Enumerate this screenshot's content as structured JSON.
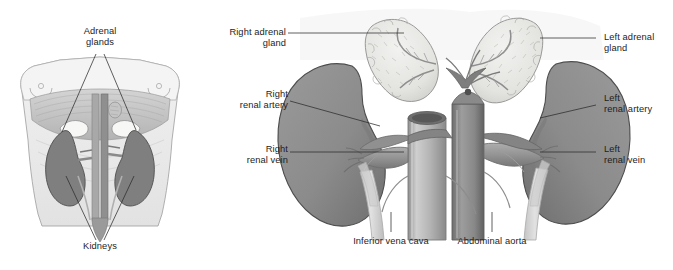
{
  "figure": {
    "type": "anatomical-illustration",
    "style": "grayscale medical line-and-wash drawing",
    "background_color": "#ffffff"
  },
  "palette": {
    "kidney_fill": "#8d8d8d",
    "kidney_fill_dark": "#6f6f6f",
    "kidney_edge": "#4a4a4a",
    "adrenal_fill": "#e6e6e4",
    "adrenal_edge": "#9a9a98",
    "vessel_light": "#b9b9b9",
    "vessel_mid": "#9c9c9c",
    "vessel_dark": "#7a7a7a",
    "ureter_fill": "#d2d2d2",
    "body_fill": "#ebebeb",
    "muscle_fill": "#c9c9c9",
    "leader_line": "#2b2b2b",
    "text": "#1d1d1d"
  },
  "inset_panel": {
    "name": "torso-overview",
    "description": "Anterior view of abdomen showing kidneys and adrenal glands in situ",
    "labels": [
      {
        "id": "adrenal-glands",
        "text": "Adrenal\nglands",
        "align": "center",
        "x": 100,
        "y": 28
      },
      {
        "id": "kidneys",
        "text": "Kidneys",
        "align": "center",
        "x": 100,
        "y": 243
      }
    ]
  },
  "main_panel": {
    "name": "kidney-detail",
    "description": "Detailed anterior view of both kidneys, adrenal glands, renal vessels, inferior vena cava and abdominal aorta",
    "labels": [
      {
        "id": "right-adrenal-gland",
        "text": "Right adrenal\ngland",
        "align": "right",
        "side": "left",
        "x": 206,
        "y": 30
      },
      {
        "id": "right-renal-artery",
        "text": "Right\nrenal artery",
        "align": "right",
        "side": "left",
        "x": 218,
        "y": 92
      },
      {
        "id": "right-renal-vein",
        "text": "Right\nrenal vein",
        "align": "right",
        "side": "left",
        "x": 222,
        "y": 147
      },
      {
        "id": "left-adrenal-gland",
        "text": "Left adrenal\ngland",
        "align": "left",
        "side": "right",
        "x": 607,
        "y": 34
      },
      {
        "id": "left-renal-artery",
        "text": "Left\nrenal artery",
        "align": "left",
        "side": "right",
        "x": 607,
        "y": 96
      },
      {
        "id": "left-renal-vein",
        "text": "Left\nrenal vein",
        "align": "left",
        "side": "right",
        "x": 607,
        "y": 147
      },
      {
        "id": "inferior-vena-cava",
        "text": "Inferior vena cava",
        "align": "center",
        "side": "bottom",
        "x": 391,
        "y": 240
      },
      {
        "id": "abdominal-aorta",
        "text": "Abdominal aorta",
        "align": "center",
        "side": "bottom",
        "x": 492,
        "y": 240
      }
    ]
  },
  "caption": {
    "text": ""
  }
}
